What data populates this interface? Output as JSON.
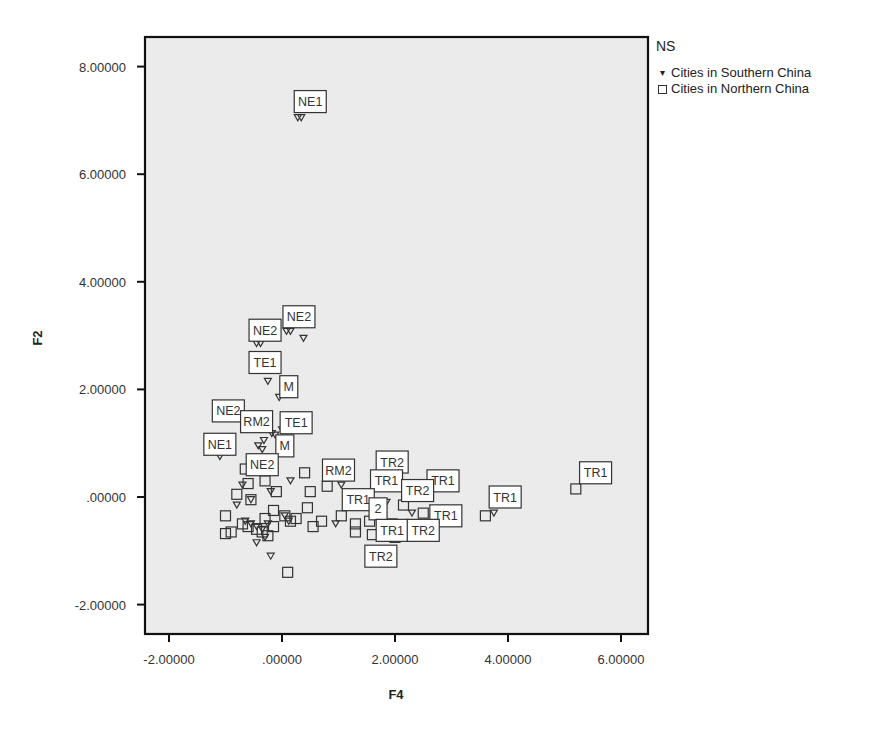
{
  "chart_data": {
    "type": "scatter",
    "title": "",
    "xlabel": "F4",
    "ylabel": "F2",
    "xlim": [
      -2.4,
      6.45
    ],
    "ylim": [
      -2.55,
      8.55
    ],
    "x_ticks": [
      -2,
      0,
      2,
      4,
      6
    ],
    "x_tick_labels": [
      "-2.00000",
      ".00000",
      "2.00000",
      "4.00000",
      "6.00000"
    ],
    "y_ticks": [
      -2,
      0,
      2,
      4,
      6,
      8
    ],
    "y_tick_labels": [
      "-2.00000",
      ".00000",
      "2.00000",
      "4.00000",
      "6.00000",
      "8.00000"
    ],
    "grid": false,
    "background": "#ececec",
    "legend": {
      "title": "NS",
      "position": "right-top",
      "entries": [
        {
          "label": "Cities in Southern China",
          "marker": "triangle-down"
        },
        {
          "label": "Cities in Northern China",
          "marker": "square"
        }
      ]
    },
    "series": [
      {
        "name": "Cities in Southern China",
        "marker": "triangle-down",
        "points": [
          {
            "x": 0.28,
            "y": 7.05,
            "label": "NE1"
          },
          {
            "x": 0.34,
            "y": 7.05
          },
          {
            "x": -0.45,
            "y": 2.85,
            "label": "NE2"
          },
          {
            "x": -0.38,
            "y": 2.85
          },
          {
            "x": 0.08,
            "y": 3.08,
            "label": "NE2"
          },
          {
            "x": 0.15,
            "y": 3.08
          },
          {
            "x": 0.38,
            "y": 2.95
          },
          {
            "x": -0.25,
            "y": 2.15,
            "label": "TE1"
          },
          {
            "x": -0.05,
            "y": 1.85,
            "label": "M"
          },
          {
            "x": -0.18,
            "y": 1.18,
            "label": "RM2"
          },
          {
            "x": -0.12,
            "y": 1.15
          },
          {
            "x": -0.32,
            "y": 1.05
          },
          {
            "x": 0.0,
            "y": 1.25,
            "label": "TE1"
          },
          {
            "x": -0.42,
            "y": 0.95
          },
          {
            "x": -0.35,
            "y": 0.88,
            "label": "M"
          },
          {
            "x": -1.1,
            "y": 0.75,
            "label": "NE1"
          },
          {
            "x": -0.7,
            "y": 0.22,
            "label": "NE2"
          },
          {
            "x": -0.55,
            "y": -0.05
          },
          {
            "x": -0.2,
            "y": 0.1
          },
          {
            "x": 0.15,
            "y": 0.3
          },
          {
            "x": -0.8,
            "y": -0.15
          },
          {
            "x": -0.65,
            "y": -0.45
          },
          {
            "x": -0.55,
            "y": -0.5
          },
          {
            "x": -0.45,
            "y": -0.55
          },
          {
            "x": -0.35,
            "y": -0.6
          },
          {
            "x": -0.25,
            "y": -0.5
          },
          {
            "x": -0.3,
            "y": -0.75
          },
          {
            "x": -0.45,
            "y": -0.85
          },
          {
            "x": -0.2,
            "y": -1.1
          },
          {
            "x": 0.05,
            "y": -0.35
          },
          {
            "x": 0.12,
            "y": -0.45
          },
          {
            "x": 1.05,
            "y": 0.22,
            "label": "RM2"
          },
          {
            "x": 0.95,
            "y": -0.5
          },
          {
            "x": 1.85,
            "y": -0.1,
            "label": "TR1"
          },
          {
            "x": 2.3,
            "y": -0.3,
            "label": "TR1"
          },
          {
            "x": 3.75,
            "y": -0.3,
            "label": "TR1"
          }
        ]
      },
      {
        "name": "Cities in Northern China",
        "marker": "square",
        "points": [
          {
            "x": -0.65,
            "y": 0.52
          },
          {
            "x": -0.6,
            "y": 0.25
          },
          {
            "x": -0.8,
            "y": 0.05
          },
          {
            "x": -0.55,
            "y": -0.05
          },
          {
            "x": -1.0,
            "y": -0.35
          },
          {
            "x": -0.9,
            "y": -0.65
          },
          {
            "x": -1.0,
            "y": -0.68
          },
          {
            "x": -0.7,
            "y": -0.5
          },
          {
            "x": -0.6,
            "y": -0.55
          },
          {
            "x": -0.45,
            "y": -0.6
          },
          {
            "x": -0.35,
            "y": -0.65
          },
          {
            "x": -0.3,
            "y": -0.4
          },
          {
            "x": -0.25,
            "y": -0.72
          },
          {
            "x": -0.15,
            "y": -0.55
          },
          {
            "x": -0.1,
            "y": 0.1
          },
          {
            "x": -0.3,
            "y": 0.3
          },
          {
            "x": -0.15,
            "y": -0.25
          },
          {
            "x": 0.05,
            "y": -0.35
          },
          {
            "x": 0.15,
            "y": -0.45
          },
          {
            "x": 0.25,
            "y": -0.4
          },
          {
            "x": 0.4,
            "y": 0.45
          },
          {
            "x": 0.5,
            "y": 0.1
          },
          {
            "x": 0.45,
            "y": -0.2
          },
          {
            "x": 0.55,
            "y": -0.55
          },
          {
            "x": 0.7,
            "y": -0.45
          },
          {
            "x": 0.1,
            "y": -1.4
          },
          {
            "x": 0.8,
            "y": 0.2
          },
          {
            "x": 1.05,
            "y": -0.35
          },
          {
            "x": 1.3,
            "y": -0.5
          },
          {
            "x": 1.3,
            "y": -0.65
          },
          {
            "x": 1.55,
            "y": -0.45
          },
          {
            "x": 1.6,
            "y": -0.7
          },
          {
            "x": 1.95,
            "y": -0.5
          },
          {
            "x": 2.0,
            "y": -0.75
          },
          {
            "x": 2.15,
            "y": -0.15,
            "label": "TR2"
          },
          {
            "x": 2.5,
            "y": -0.3,
            "label": "TR1"
          },
          {
            "x": 3.6,
            "y": -0.35,
            "label": "TR1"
          },
          {
            "x": 5.2,
            "y": 0.15,
            "label": "TR1"
          }
        ]
      }
    ],
    "annotations": [
      {
        "text": "NE1",
        "x": 0.5,
        "y": 7.35
      },
      {
        "text": "NE2",
        "x": -0.3,
        "y": 3.1
      },
      {
        "text": "NE2",
        "x": 0.3,
        "y": 3.35
      },
      {
        "text": "TE1",
        "x": -0.3,
        "y": 2.5
      },
      {
        "text": "M",
        "x": 0.12,
        "y": 2.05
      },
      {
        "text": "NE2",
        "x": -0.95,
        "y": 1.6
      },
      {
        "text": "RM2",
        "x": -0.45,
        "y": 1.4
      },
      {
        "text": "TE1",
        "x": 0.25,
        "y": 1.38
      },
      {
        "text": "NE1",
        "x": -1.1,
        "y": 0.98
      },
      {
        "text": "M",
        "x": 0.05,
        "y": 0.95
      },
      {
        "text": "NE2",
        "x": -0.35,
        "y": 0.6
      },
      {
        "text": "RM2",
        "x": 1.0,
        "y": 0.5
      },
      {
        "text": "TR2",
        "x": 1.95,
        "y": 0.65
      },
      {
        "text": "TR1",
        "x": 1.85,
        "y": 0.3
      },
      {
        "text": "TR1",
        "x": 2.85,
        "y": 0.3
      },
      {
        "text": "TR2",
        "x": 2.4,
        "y": 0.12
      },
      {
        "text": "TR1",
        "x": 1.35,
        "y": -0.05
      },
      {
        "text": "2",
        "x": 1.7,
        "y": -0.22
      },
      {
        "text": "TR1",
        "x": 2.9,
        "y": -0.35
      },
      {
        "text": "TR1",
        "x": 1.95,
        "y": -0.62
      },
      {
        "text": "TR2",
        "x": 2.5,
        "y": -0.62
      },
      {
        "text": "TR2",
        "x": 1.75,
        "y": -1.1
      },
      {
        "text": "TR1",
        "x": 3.95,
        "y": 0.0
      },
      {
        "text": "TR1",
        "x": 5.55,
        "y": 0.45
      }
    ]
  },
  "legend": {
    "title": "NS",
    "items": [
      {
        "label": "Cities in Southern China",
        "symbol": "▾"
      },
      {
        "label": "Cities in Northern China",
        "symbol": "☐"
      }
    ]
  },
  "axes": {
    "xlabel": "F4",
    "ylabel": "F2"
  }
}
